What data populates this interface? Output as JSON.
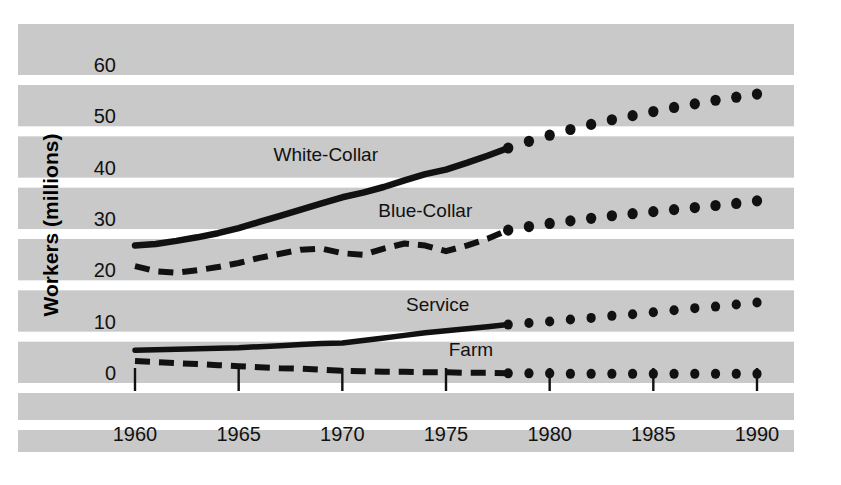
{
  "chart_data": {
    "type": "line",
    "title": "",
    "xlabel": "",
    "ylabel": "Workers (millions)",
    "xlim": [
      1960,
      1990
    ],
    "ylim": [
      0,
      60
    ],
    "xticks": [
      1960,
      1965,
      1970,
      1975,
      1980,
      1985,
      1990
    ],
    "yticks": [
      0,
      10,
      20,
      30,
      40,
      50,
      60
    ],
    "grid": "horizontal-white-bands",
    "legend": "inline-series-labels",
    "projection_starts": 1978,
    "series": [
      {
        "name": "White-Collar",
        "style": "solid",
        "label_x": 1969.2,
        "label_y": 42.5,
        "historical": {
          "x": [
            1960,
            1961,
            1962,
            1963,
            1964,
            1965,
            1966,
            1967,
            1968,
            1969,
            1970,
            1971,
            1972,
            1973,
            1974,
            1975,
            1976,
            1977,
            1978
          ],
          "y": [
            26.0,
            26.3,
            26.9,
            27.6,
            28.4,
            29.4,
            30.6,
            31.8,
            33.0,
            34.2,
            35.4,
            36.3,
            37.4,
            38.7,
            39.9,
            40.8,
            42.1,
            43.5,
            45.0
          ]
        },
        "projected": {
          "x": [
            1979,
            1980,
            1981,
            1982,
            1983,
            1984,
            1985,
            1986,
            1987,
            1988,
            1989,
            1990
          ],
          "y": [
            46.3,
            47.5,
            48.6,
            49.6,
            50.5,
            51.3,
            52.1,
            52.9,
            53.6,
            54.3,
            54.9,
            55.5
          ]
        }
      },
      {
        "name": "Blue-Collar",
        "style": "dashed",
        "label_x": 1974.0,
        "label_y": 31.5,
        "historical": {
          "x": [
            1960,
            1961,
            1962,
            1963,
            1964,
            1965,
            1966,
            1967,
            1968,
            1969,
            1970,
            1971,
            1972,
            1973,
            1974,
            1975,
            1976,
            1977,
            1978
          ],
          "y": [
            22.0,
            21.0,
            20.7,
            21.2,
            21.8,
            22.6,
            23.6,
            24.4,
            25.2,
            25.4,
            24.5,
            24.2,
            25.4,
            26.4,
            26.0,
            24.9,
            26.0,
            27.3,
            29.0
          ]
        },
        "projected": {
          "x": [
            1979,
            1980,
            1981,
            1982,
            1983,
            1984,
            1985,
            1986,
            1987,
            1988,
            1989,
            1990
          ],
          "y": [
            29.7,
            30.3,
            30.8,
            31.3,
            31.8,
            32.2,
            32.6,
            33.0,
            33.4,
            33.8,
            34.2,
            34.7
          ]
        }
      },
      {
        "name": "Service",
        "style": "solid",
        "label_x": 1974.6,
        "label_y": 13.2,
        "historical": {
          "x": [
            1960,
            1961,
            1962,
            1963,
            1964,
            1965,
            1966,
            1967,
            1968,
            1969,
            1970,
            1971,
            1972,
            1973,
            1974,
            1975,
            1976,
            1977,
            1978
          ],
          "y": [
            5.6,
            5.7,
            5.8,
            5.9,
            6.0,
            6.1,
            6.3,
            6.5,
            6.7,
            6.9,
            7.0,
            7.5,
            8.0,
            8.5,
            9.0,
            9.4,
            9.8,
            10.2,
            10.6
          ]
        },
        "projected": {
          "x": [
            1979,
            1980,
            1981,
            1982,
            1983,
            1984,
            1985,
            1986,
            1987,
            1988,
            1989,
            1990
          ],
          "y": [
            10.9,
            11.2,
            11.6,
            11.9,
            12.3,
            12.6,
            13.0,
            13.4,
            13.8,
            14.1,
            14.5,
            14.9
          ]
        }
      },
      {
        "name": "Farm",
        "style": "dashed",
        "label_x": 1976.2,
        "label_y": 4.4,
        "historical": {
          "x": [
            1960,
            1961,
            1962,
            1963,
            1964,
            1965,
            1966,
            1967,
            1968,
            1969,
            1970,
            1971,
            1972,
            1973,
            1974,
            1975,
            1976,
            1977,
            1978
          ],
          "y": [
            3.5,
            3.3,
            3.1,
            2.9,
            2.7,
            2.5,
            2.3,
            2.1,
            2.0,
            1.8,
            1.6,
            1.5,
            1.4,
            1.4,
            1.3,
            1.3,
            1.2,
            1.2,
            1.1
          ]
        },
        "projected": {
          "x": [
            1979,
            1980,
            1981,
            1982,
            1983,
            1984,
            1985,
            1986,
            1987,
            1988,
            1989,
            1990
          ],
          "y": [
            1.1,
            1.1,
            1.0,
            1.0,
            1.0,
            1.0,
            1.0,
            1.0,
            1.0,
            1.0,
            1.0,
            1.0
          ]
        }
      }
    ]
  },
  "colors": {
    "panel_background": "#c9c9c9",
    "gridline": "#ffffff",
    "ink": "#111111",
    "page_background": "#ffffff"
  }
}
